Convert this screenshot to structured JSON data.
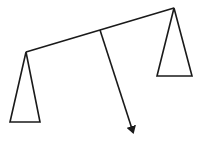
{
  "diagram": {
    "title": "",
    "stroke_color": "#1a1a1a",
    "background": "#ffffff",
    "beam": {
      "x1": 26,
      "y1": 52,
      "x2": 174,
      "y2": 8
    },
    "left_pan": {
      "apex": [
        26,
        52
      ],
      "base_left": [
        10,
        122
      ],
      "base_right": [
        40,
        122
      ]
    },
    "right_pan": {
      "apex": [
        174,
        8
      ],
      "base_left": [
        157,
        76
      ],
      "base_right": [
        192,
        76
      ]
    },
    "force_arrow": {
      "x1": 100,
      "y1": 30,
      "x2": 134,
      "y2": 136
    }
  }
}
